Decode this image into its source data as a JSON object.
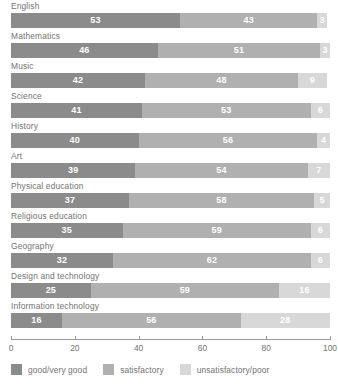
{
  "chart_data": {
    "type": "bar",
    "orientation": "horizontal",
    "stacked": true,
    "title": "",
    "subtitle": "",
    "xlabel": "",
    "ylabel": "",
    "xlim": [
      0,
      100
    ],
    "xticks": [
      0,
      20,
      40,
      60,
      80,
      100
    ],
    "xtick_labels": [
      "0",
      "20",
      "40",
      "60",
      "80",
      "100"
    ],
    "grid": false,
    "legend_position": "bottom-left",
    "categories": [
      "English",
      "Mathematics",
      "Music",
      "Science",
      "History",
      "Art",
      "Physical education",
      "Religious education",
      "Geography",
      "Design and technology",
      "Information technology"
    ],
    "series": [
      {
        "name": "good/very good",
        "color": "#8b8b8b",
        "values": [
          53,
          46,
          42,
          41,
          40,
          39,
          37,
          35,
          32,
          25,
          16
        ]
      },
      {
        "name": "satisfactory",
        "color": "#b0b0b0",
        "values": [
          43,
          51,
          48,
          53,
          56,
          54,
          58,
          59,
          62,
          59,
          56
        ]
      },
      {
        "name": "unsatisfactory/poor",
        "color": "#d8d8d8",
        "values": [
          3,
          3,
          9,
          6,
          4,
          7,
          5,
          6,
          6,
          16,
          28
        ]
      }
    ]
  },
  "legend": {
    "items": [
      {
        "label": "good/very good",
        "swatch": "s-good"
      },
      {
        "label": "satisfactory",
        "swatch": "s-sat"
      },
      {
        "label": "unsatisfactory/poor",
        "swatch": "s-unsat"
      }
    ]
  },
  "colors": {
    "good": "#8b8b8b",
    "satisfactory": "#b0b0b0",
    "unsatisfactory": "#d8d8d8",
    "axis": "#9a9a9a",
    "text": "#737373",
    "value_text": "#ffffff",
    "background": "#ffffff"
  }
}
